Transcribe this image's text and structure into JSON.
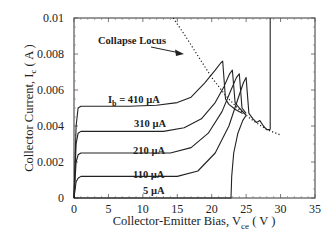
{
  "chart_data": {
    "type": "line",
    "title": "",
    "xlabel": "Collector-Emitter Bias, V",
    "xlabel_sub": "ce",
    "xlabel_unit": "( V )",
    "ylabel": "Collector Current, I",
    "ylabel_sub": "c",
    "ylabel_unit": "( A )",
    "xlim": [
      0,
      35
    ],
    "ylim": [
      0,
      0.01
    ],
    "xticks": [
      0,
      5,
      10,
      15,
      20,
      25,
      30,
      35
    ],
    "xtick_labels": [
      "0",
      "5",
      "10",
      "15",
      "20",
      "25",
      "30",
      "35"
    ],
    "yticks": [
      0,
      0.002,
      0.004,
      0.006,
      0.008,
      0.01
    ],
    "ytick_labels": [
      "0",
      "0.002",
      "0.004",
      "0.006",
      "0.008",
      "0.01"
    ],
    "grid": false,
    "legend": "none (inline labels)",
    "annotations": [
      {
        "text": "Collapse Locus",
        "arrow_to": [
          22.5,
          0.0074
        ]
      },
      {
        "text": "I_b = 410  µA"
      },
      {
        "text": "310  µA"
      },
      {
        "text": "210  µA"
      },
      {
        "text": "110  µA"
      },
      {
        "text": "5  µA"
      }
    ],
    "series": [
      {
        "name": "Ib = 410 µA",
        "style": "solid",
        "x": [
          0,
          0.3,
          0.6,
          1.0,
          3,
          8,
          12,
          15,
          17,
          19,
          20.5,
          21.3,
          21.6,
          22.0,
          22.5,
          23.5,
          24.5
        ],
        "y": [
          0,
          0.004,
          0.005,
          0.0051,
          0.0051,
          0.0051,
          0.00515,
          0.0053,
          0.0056,
          0.0064,
          0.0071,
          0.0075,
          0.0076,
          0.0055,
          0.0052,
          0.0049,
          0.0047
        ]
      },
      {
        "name": "Ib = 310 µA",
        "style": "solid",
        "x": [
          0,
          0.3,
          0.6,
          1.0,
          3,
          8,
          13,
          16,
          18.5,
          20.5,
          21.8,
          22.6,
          23.0,
          23.4,
          24.0,
          25.0
        ],
        "y": [
          0,
          0.003,
          0.0036,
          0.0037,
          0.0037,
          0.0037,
          0.0037,
          0.0039,
          0.0044,
          0.0053,
          0.0062,
          0.0069,
          0.0071,
          0.0053,
          0.005,
          0.0046
        ]
      },
      {
        "name": "Ib = 210 µA",
        "style": "solid",
        "x": [
          0,
          0.3,
          0.6,
          1.0,
          3,
          9,
          14,
          17,
          19.5,
          21.5,
          22.8,
          23.6,
          24.0,
          24.4,
          25.0
        ],
        "y": [
          0,
          0.002,
          0.0024,
          0.0025,
          0.0025,
          0.0025,
          0.0025,
          0.0028,
          0.0036,
          0.0048,
          0.006,
          0.0067,
          0.0069,
          0.005,
          0.0047
        ]
      },
      {
        "name": "Ib = 110 µA",
        "style": "solid",
        "x": [
          0,
          0.3,
          0.6,
          1.0,
          3,
          10,
          15,
          18,
          20.5,
          22.5,
          23.8,
          24.6,
          25.0,
          25.4,
          26.0,
          26.5,
          27.0,
          27.5,
          28.0,
          28.5
        ],
        "y": [
          0,
          0.0009,
          0.0011,
          0.0012,
          0.0012,
          0.0012,
          0.0012,
          0.0015,
          0.0025,
          0.004,
          0.0055,
          0.0064,
          0.0067,
          0.0047,
          0.0044,
          0.0042,
          0.0043,
          0.004,
          0.0038,
          0.0038
        ]
      },
      {
        "name": "Ib = 5 µA",
        "style": "solid",
        "x": [
          0,
          22.8,
          22.9,
          23.2,
          23.8,
          24.5,
          25.0
        ],
        "y": [
          0,
          0,
          0.0012,
          0.0025,
          0.0036,
          0.0043,
          0.0046
        ]
      },
      {
        "name": "Breakdown edge",
        "style": "solid",
        "x": [
          28.5,
          28.5
        ],
        "y": [
          0.0038,
          0.01
        ]
      },
      {
        "name": "Collapse Locus",
        "style": "dotted",
        "x": [
          14.4,
          16,
          18,
          20,
          22,
          24,
          26,
          28,
          30
        ],
        "y": [
          0.01,
          0.0091,
          0.0079,
          0.0067,
          0.0057,
          0.0049,
          0.0043,
          0.0038,
          0.0035
        ]
      }
    ]
  },
  "labels": {
    "collapse_locus": "Collapse Locus",
    "ib_prefix": "I",
    "ib_sub": "b",
    "ib_410": " = 410  µA",
    "ib_310": "310  µA",
    "ib_210": "210  µA",
    "ib_110": "110  µA",
    "ib_5": "5  µA"
  }
}
